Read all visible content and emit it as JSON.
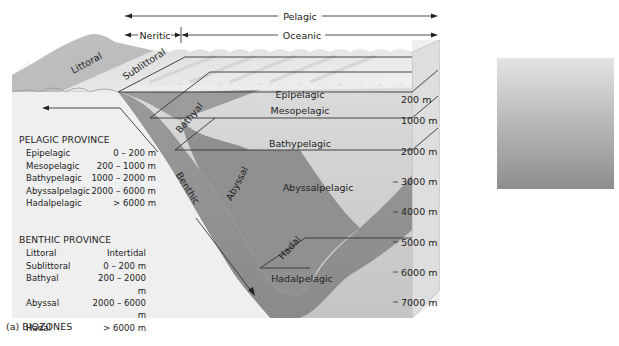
{
  "biozones": {
    "caption": "(a) BIOZONES",
    "top_labels": {
      "pelagic": "Pelagic",
      "neritic": "Neritic",
      "oceanic": "Oceanic"
    },
    "surface_labels": {
      "littoral": "Littoral",
      "sublittoral": "Sublittoral"
    },
    "pelagic_zone_labels": {
      "epipelagic": "Epipelagic",
      "mesopelagic": "Mesopelagic",
      "bathypelagic": "Bathypelagic",
      "abyssalpelagic": "Abyssalpelagic",
      "hadalpelagic": "Hadalpelagic"
    },
    "benthic_zone_labels": {
      "benthic": "Benthic",
      "bathyal": "Bathyal",
      "abyssal": "Abyssal",
      "hadal": "Hadal"
    },
    "depth_labels": [
      "200 m",
      "1000 m",
      "2000 m",
      "3000 m",
      "4000 m",
      "5000 m",
      "6000 m",
      "7000 m"
    ],
    "pelagic_province": {
      "title": "PELAGIC PROVINCE",
      "rows": [
        {
          "name": "Epipelagic",
          "range": "0 – 200 m"
        },
        {
          "name": "Mesopelagic",
          "range": "200 – 1000 m"
        },
        {
          "name": "Bathypelagic",
          "range": "1000 – 2000 m"
        },
        {
          "name": "Abyssalpelagic",
          "range": "2000 – 6000 m"
        },
        {
          "name": "Hadalpelagic",
          "range": "> 6000 m"
        }
      ]
    },
    "benthic_province": {
      "title": "BENTHIC PROVINCE",
      "rows": [
        {
          "name": "Littoral",
          "range": "Intertidal"
        },
        {
          "name": "Sublittoral",
          "range": "0 – 200 m"
        },
        {
          "name": "Bathyal",
          "range": "200 – 2000 m"
        },
        {
          "name": "Abyssal",
          "range": "2000 – 6000 m"
        },
        {
          "name": "Hadal",
          "range": "> 6000 m"
        }
      ]
    }
  },
  "light_zones": {
    "caption": "(b) LIGHT ZONES",
    "y_axis_label": "Water depth (m)",
    "y_ticks": [
      "0",
      "100",
      "200",
      "300",
      "400",
      "500",
      "600"
    ],
    "wavelengths": [
      "Ultraviolet",
      "red",
      "yellow",
      "green",
      "blue"
    ],
    "zones": [
      {
        "light": "Light",
        "name": "Photic",
        "suffix": "zone",
        "from": 0,
        "to": 100
      },
      {
        "light": "\"Twilight\"",
        "name": "Dysphotic",
        "suffix": "zone",
        "from": 100,
        "to": 460
      },
      {
        "light": "Dark",
        "name": "Aphotic",
        "suffix": "zone",
        "from": 460,
        "to": 650
      }
    ]
  },
  "colors": {
    "land": "#b8b8b8",
    "water_surface": "#e6e6e6",
    "water_column": "#d0d0d0",
    "seafloor_dark": "#8e8e8e",
    "block_side": "#efefef",
    "light_top": "#e2e2e2",
    "light_bottom": "#8c8c8c"
  }
}
